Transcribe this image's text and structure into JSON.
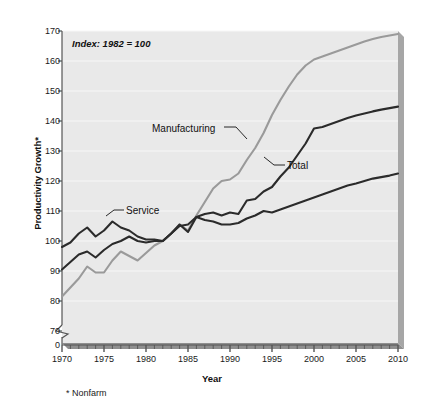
{
  "chart_data": {
    "type": "line",
    "title": "",
    "annotation": "Index: 1982 = 100",
    "footnote": "* Nonfarm",
    "xlabel": "Year",
    "ylabel": "Productivity Growth*",
    "xlim": [
      1970,
      2010
    ],
    "ylim": [
      70,
      170
    ],
    "y_axis_break": true,
    "y_break_label": "0",
    "grid": true,
    "grid_axis": "y",
    "legend_position": "inline-labels",
    "y_ticks": [
      70,
      80,
      90,
      100,
      110,
      120,
      130,
      140,
      150,
      160,
      170
    ],
    "x_ticks": [
      1970,
      1975,
      1980,
      1985,
      1990,
      1995,
      2000,
      2005,
      2010
    ],
    "x_minor_tick_interval": 1,
    "x": [
      1970,
      1971,
      1972,
      1973,
      1974,
      1975,
      1976,
      1977,
      1978,
      1979,
      1980,
      1981,
      1982,
      1983,
      1984,
      1985,
      1986,
      1987,
      1988,
      1989,
      1990,
      1991,
      1992,
      1993,
      1994,
      1995,
      1996,
      1997,
      1998,
      1999,
      2000,
      2001,
      2002,
      2003,
      2004,
      2005,
      2006,
      2007,
      2008,
      2009,
      2010
    ],
    "series": [
      {
        "name": "Manufacturing",
        "color": "#9a9a9a",
        "values": [
          81.5,
          84.5,
          87.5,
          91.5,
          89.5,
          89.5,
          93.5,
          96.5,
          95.0,
          93.5,
          96.0,
          98.5,
          100.0,
          102.5,
          105.5,
          103.5,
          108.5,
          113.0,
          117.5,
          120.0,
          120.5,
          122.5,
          127.0,
          131.0,
          136.0,
          142.0,
          147.0,
          151.5,
          155.5,
          158.5,
          160.5,
          161.5,
          162.5,
          163.5,
          164.5,
          165.5,
          166.5,
          167.3,
          168.0,
          168.5,
          169.0
        ]
      },
      {
        "name": "Total",
        "color": "#2b2b2b",
        "values": [
          90.5,
          93.0,
          95.5,
          96.5,
          94.5,
          97.0,
          99.0,
          100.0,
          101.5,
          100.0,
          99.5,
          100.0,
          100.0,
          102.5,
          105.0,
          105.5,
          108.0,
          109.0,
          109.5,
          108.5,
          109.5,
          109.0,
          113.5,
          114.0,
          116.5,
          118.0,
          121.5,
          124.5,
          128.5,
          132.5,
          137.5,
          138.0,
          139.0,
          140.0,
          141.0,
          141.8,
          142.5,
          143.2,
          143.8,
          144.3,
          144.8
        ]
      },
      {
        "name": "Service",
        "color": "#2b2b2b",
        "values": [
          98.0,
          99.5,
          102.5,
          104.5,
          101.5,
          103.5,
          106.5,
          104.5,
          103.5,
          101.5,
          100.5,
          100.5,
          100.0,
          102.5,
          105.5,
          103.0,
          108.0,
          107.0,
          106.5,
          105.5,
          105.5,
          106.0,
          107.5,
          108.5,
          110.0,
          109.5,
          110.5,
          111.5,
          112.5,
          113.5,
          114.5,
          115.5,
          116.5,
          117.5,
          118.5,
          119.2,
          120.0,
          120.8,
          121.3,
          121.8,
          122.5
        ]
      }
    ],
    "series_labels": [
      {
        "name": "Manufacturing",
        "text": "Manufacturing"
      },
      {
        "name": "Total",
        "text": "Total"
      },
      {
        "name": "Service",
        "text": "Service"
      }
    ]
  },
  "style": {
    "plot_background": "#e9e9e9",
    "gridline_color": "#f7f7f7",
    "axis_color": "#555555",
    "shadow_color": "#9f9f9f",
    "text_color": "#111111"
  }
}
